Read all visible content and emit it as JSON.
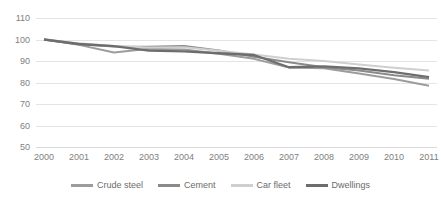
{
  "chart_data": {
    "type": "line",
    "title": "",
    "xlabel": "",
    "ylabel": "",
    "x": [
      2000,
      2001,
      2002,
      2003,
      2004,
      2005,
      2006,
      2007,
      2008,
      2009,
      2010,
      2011
    ],
    "categories": [
      "2000",
      "2001",
      "2002",
      "2003",
      "2004",
      "2005",
      "2006",
      "2007",
      "2008",
      "2009",
      "2010",
      "2011"
    ],
    "ylim": [
      50,
      110
    ],
    "ytick_step": 10,
    "yticks": [
      110,
      100,
      90,
      80,
      70,
      60,
      50
    ],
    "ytick_labels": [
      "110",
      "100",
      "90",
      "80",
      "70",
      "60",
      "50"
    ],
    "grid": true,
    "grid_axis": "y",
    "legend_position": "bottom",
    "series": [
      {
        "name": "Crude steel",
        "color": "#9c9c9c",
        "width": 2.0,
        "values": [
          100.0,
          97.5,
          94.0,
          95.7,
          95.3,
          93.4,
          91.0,
          87.0,
          86.6,
          84.2,
          81.6,
          78.5
        ]
      },
      {
        "name": "Cement",
        "color": "#8a8a8a",
        "width": 2.0,
        "values": [
          100.0,
          97.8,
          96.8,
          96.6,
          97.0,
          94.9,
          92.0,
          89.4,
          87.1,
          85.6,
          83.4,
          81.7
        ]
      },
      {
        "name": "Car fleet",
        "color": "#cfcfcf",
        "width": 2.0,
        "values": [
          100.0,
          98.2,
          97.0,
          96.3,
          96.4,
          94.8,
          93.0,
          91.1,
          90.0,
          88.4,
          86.9,
          85.6
        ]
      },
      {
        "name": "Dwellings",
        "color": "#6d6d6d",
        "width": 2.3,
        "values": [
          100.0,
          97.9,
          96.9,
          94.8,
          94.5,
          93.6,
          92.8,
          87.1,
          87.5,
          86.6,
          84.8,
          82.5
        ]
      }
    ]
  },
  "axis": {
    "y_labels": [
      "110",
      "100",
      "90",
      "80",
      "70",
      "60",
      "50"
    ],
    "x_labels": [
      "2000",
      "2001",
      "2002",
      "2003",
      "2004",
      "2005",
      "2006",
      "2007",
      "2008",
      "2009",
      "2010",
      "2011"
    ]
  },
  "legend": {
    "items": [
      {
        "label": "Crude steel",
        "color": "#9c9c9c"
      },
      {
        "label": "Cement",
        "color": "#8a8a8a"
      },
      {
        "label": "Car fleet",
        "color": "#cfcfcf"
      },
      {
        "label": "Dwellings",
        "color": "#6d6d6d"
      }
    ]
  },
  "colors": {
    "grid": "#e4e4e4",
    "tick_text": "#808080",
    "legend_text": "#6b6b6b",
    "background": "#ffffff"
  }
}
